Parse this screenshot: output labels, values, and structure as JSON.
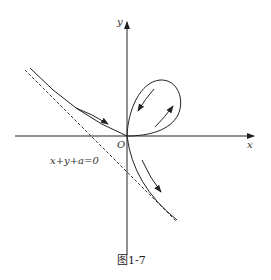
{
  "diagram": {
    "axis_x_label": "x",
    "axis_y_label": "y",
    "origin_label": "O",
    "asymptote_label": "x+y+a=0",
    "caption": "图1-7",
    "colors": {
      "stroke": "#222222",
      "background": "#ffffff"
    }
  }
}
